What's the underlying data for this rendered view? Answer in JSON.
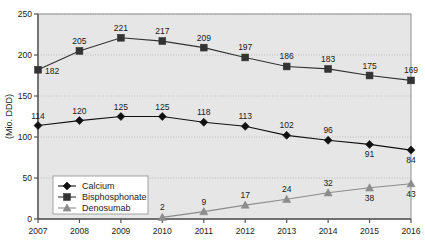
{
  "chart_data": {
    "type": "line",
    "title": "",
    "xlabel": "",
    "ylabel": "(Mio. DDD)",
    "categories": [
      "2007",
      "2008",
      "2009",
      "2010",
      "2011",
      "2012",
      "2013",
      "2014",
      "2015",
      "2016"
    ],
    "ylim": [
      0,
      250
    ],
    "yticks": [
      "0",
      "50",
      "100",
      "150",
      "200",
      "250"
    ],
    "grid": true,
    "legend_position": "inside-lower-left",
    "series": [
      {
        "name": "Calcium",
        "marker": "diamond",
        "color": "#111111",
        "values": [
          114,
          120,
          125,
          125,
          118,
          113,
          102,
          96,
          91,
          84
        ],
        "labels": [
          "114",
          "120",
          "125",
          "125",
          "118",
          "113",
          "102",
          "96",
          "91",
          "84"
        ],
        "label_positions": [
          "above",
          "above",
          "above",
          "above",
          "above",
          "above",
          "above",
          "above",
          "below",
          "below"
        ]
      },
      {
        "name": "Bisphosphonate",
        "marker": "square",
        "color": "#333333",
        "values": [
          182,
          205,
          221,
          217,
          209,
          197,
          186,
          183,
          175,
          169
        ],
        "labels": [
          "182",
          "205",
          "221",
          "217",
          "209",
          "197",
          "186",
          "183",
          "175",
          "169"
        ],
        "label_positions": [
          "right",
          "above",
          "above",
          "above",
          "above",
          "above",
          "above",
          "above",
          "above",
          "above"
        ]
      },
      {
        "name": "Denosumab",
        "marker": "triangle",
        "color": "#8c8c8c",
        "values": [
          null,
          null,
          null,
          2,
          9,
          17,
          24,
          32,
          38,
          43
        ],
        "labels": [
          "",
          "",
          "",
          "2",
          "9",
          "17",
          "24",
          "32",
          "38",
          "43"
        ],
        "label_positions": [
          "",
          "",
          "",
          "above",
          "above",
          "above",
          "above",
          "above",
          "below",
          "below"
        ]
      }
    ]
  },
  "legend": {
    "items": [
      {
        "label": "Calcium"
      },
      {
        "label": "Bisphosphonate"
      },
      {
        "label": "Denosumab"
      }
    ]
  },
  "colors": {
    "plot_background": "#e6e6e6",
    "grid": "#b8b8b8",
    "axis": "#555555",
    "calcium": "#111111",
    "bisphosphonate": "#333333",
    "denosumab": "#8c8c8c",
    "legend_background": "#ffffff",
    "legend_border": "#9a9a9a"
  }
}
